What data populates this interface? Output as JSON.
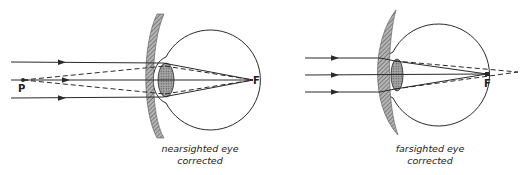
{
  "diagrams": [
    {
      "id": "nearsighted",
      "caption_line1": "nearsighted eye",
      "caption_line2": "corrected",
      "point_label": "P",
      "focus_label": "F",
      "lens_type": "concave (diverging)"
    },
    {
      "id": "farsighted",
      "caption_line1": "farsighted eye",
      "caption_line2": "corrected",
      "focus_label": "F",
      "lens_type": "convex (converging)"
    }
  ],
  "colors": {
    "line": "#2a2a2a",
    "lens_fill": "#8a8a8a",
    "background": "#ffffff"
  }
}
